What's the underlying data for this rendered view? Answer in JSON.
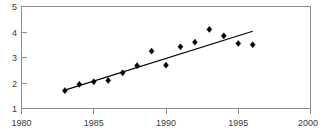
{
  "chart_data": {
    "type": "scatter",
    "title": "",
    "subtitle": "",
    "xlabel": "",
    "ylabel": "",
    "xlim": [
      1980,
      2000
    ],
    "ylim": [
      1,
      5
    ],
    "grid": false,
    "legend": false,
    "legend_position": "none",
    "x_ticks": [
      1980,
      1985,
      1990,
      1995,
      2000
    ],
    "x_tick_labels": [
      "1980",
      "1985",
      "1990",
      "1995",
      "2000"
    ],
    "y_ticks": [
      1,
      2,
      3,
      4,
      5
    ],
    "y_tick_labels": [
      "1",
      "2",
      "3",
      "4",
      "5"
    ],
    "marker": "diamond",
    "marker_color": "#000000",
    "x": [
      1983,
      1984,
      1985,
      1986,
      1987,
      1988,
      1989,
      1990,
      1991,
      1992,
      1993,
      1994,
      1995,
      1996
    ],
    "values": [
      1.7,
      1.95,
      2.05,
      2.1,
      2.4,
      2.68,
      3.25,
      2.7,
      3.42,
      3.6,
      4.1,
      3.85,
      3.55,
      3.5
    ],
    "series": [
      {
        "name": "observations",
        "type": "scatter",
        "x": [
          1983,
          1984,
          1985,
          1986,
          1987,
          1988,
          1989,
          1990,
          1991,
          1992,
          1993,
          1994,
          1995,
          1996
        ],
        "values": [
          1.7,
          1.95,
          2.05,
          2.1,
          2.4,
          2.68,
          3.25,
          2.7,
          3.42,
          3.6,
          4.1,
          3.85,
          3.55,
          3.5
        ]
      },
      {
        "name": "trend-line",
        "type": "line",
        "x": [
          1983,
          1996
        ],
        "values": [
          1.72,
          4.03
        ],
        "color": "#000000"
      }
    ],
    "annotations": []
  },
  "axes": {
    "frame_color": "#8c8c8c",
    "tick_color": "#8c8c8c",
    "label_color": "#3a3a3a"
  }
}
